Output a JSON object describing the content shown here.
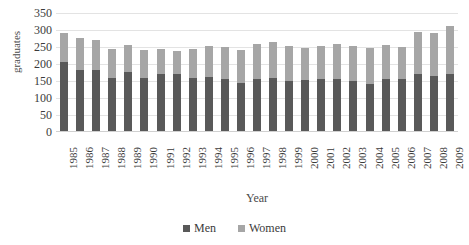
{
  "chart_data": {
    "type": "bar",
    "subtype": "stacked-column",
    "title": "",
    "title_note": "chart title is cropped off the top edge of the screenshot and is illegible",
    "xlabel": "Year",
    "ylabel": "graduates",
    "ylim": [
      0,
      350
    ],
    "yticks": [
      0,
      50,
      100,
      150,
      200,
      250,
      300,
      350
    ],
    "ytick_labels": [
      "0",
      "50",
      "100",
      "150",
      "200",
      "250",
      "300",
      "350"
    ],
    "grid": true,
    "legend_position": "bottom",
    "categories": [
      "1985",
      "1986",
      "1987",
      "1988",
      "1989",
      "1990",
      "1991",
      "1992",
      "1993",
      "1994",
      "1995",
      "1996",
      "1997",
      "1998",
      "1999",
      "2000",
      "2001",
      "2002",
      "2003",
      "2004",
      "2005",
      "2006",
      "2007",
      "2008",
      "2009"
    ],
    "series": [
      {
        "name": "Men",
        "color": "#595959",
        "values": [
          207,
          182,
          182,
          160,
          176,
          160,
          170,
          170,
          160,
          163,
          155,
          145,
          155,
          160,
          150,
          152,
          155,
          155,
          150,
          140,
          155,
          155,
          172,
          165,
          170
        ]
      },
      {
        "name": "Women",
        "color": "#a6a6a6",
        "values": [
          85,
          96,
          88,
          85,
          79,
          80,
          74,
          69,
          83,
          90,
          96,
          97,
          103,
          105,
          102,
          95,
          97,
          103,
          102,
          108,
          100,
          95,
          123,
          125,
          143
        ]
      }
    ],
    "totals": [
      292,
      278,
      270,
      245,
      255,
      240,
      244,
      239,
      243,
      253,
      251,
      242,
      258,
      265,
      252,
      247,
      252,
      258,
      252,
      248,
      255,
      250,
      295,
      290,
      313
    ]
  },
  "legend": {
    "items": [
      {
        "label": "Men",
        "color": "#595959"
      },
      {
        "label": "Women",
        "color": "#a6a6a6"
      }
    ]
  }
}
